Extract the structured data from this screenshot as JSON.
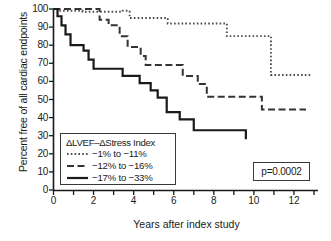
{
  "chart_data": {
    "type": "line",
    "title": "",
    "xlabel": "Years after index study",
    "ylabel": "Percent free of all cardiac endpoints",
    "xlim": [
      0,
      13.2
    ],
    "ylim": [
      0,
      100
    ],
    "xticks": [
      0,
      2,
      4,
      6,
      8,
      10,
      12
    ],
    "xticklabels": [
      "0",
      "2",
      "4",
      "6",
      "8",
      "10",
      "12"
    ],
    "xminorticks": [
      1,
      3,
      5,
      7,
      9,
      11,
      13
    ],
    "yticks": [
      0,
      10,
      20,
      30,
      40,
      50,
      60,
      70,
      80,
      90,
      100
    ],
    "yticklabels": [
      "0",
      "10",
      "20",
      "30",
      "40",
      "50",
      "60",
      "70",
      "80",
      "90",
      "100"
    ],
    "grid": false,
    "legend_position": "lower-left",
    "legend_title": "ΔLVEF–ΔStress Index",
    "annotation": "p=0.0002",
    "series": [
      {
        "name": "-1% to -11%",
        "label": "−1% to  −11%",
        "style": "dotted",
        "color": "#4d4d4d",
        "points": [
          [
            0.0,
            100
          ],
          [
            0.25,
            100
          ],
          [
            0.25,
            99
          ],
          [
            1.45,
            99
          ],
          [
            1.45,
            98.5
          ],
          [
            3.45,
            98.5
          ],
          [
            3.45,
            99
          ],
          [
            3.8,
            99
          ],
          [
            3.8,
            95
          ],
          [
            5.7,
            95
          ],
          [
            5.7,
            92
          ],
          [
            8.65,
            92
          ],
          [
            8.65,
            85
          ],
          [
            10.85,
            85
          ],
          [
            10.85,
            63.5
          ],
          [
            12.85,
            63.5
          ]
        ]
      },
      {
        "name": "-12% to -16%",
        "label": "−12% to  −16%",
        "style": "dashed",
        "color": "#333333",
        "points": [
          [
            0.0,
            100
          ],
          [
            2.3,
            100
          ],
          [
            2.3,
            94
          ],
          [
            2.75,
            94
          ],
          [
            2.75,
            91
          ],
          [
            3.3,
            91
          ],
          [
            3.3,
            85
          ],
          [
            3.7,
            85
          ],
          [
            3.7,
            79
          ],
          [
            4.35,
            79
          ],
          [
            4.35,
            74
          ],
          [
            4.6,
            74
          ],
          [
            4.6,
            69
          ],
          [
            6.45,
            69
          ],
          [
            6.45,
            63
          ],
          [
            7.2,
            63
          ],
          [
            7.2,
            58.5
          ],
          [
            7.65,
            58.5
          ],
          [
            7.65,
            51.5
          ],
          [
            10.4,
            51.5
          ],
          [
            10.4,
            44.5
          ],
          [
            12.6,
            44.5
          ]
        ]
      },
      {
        "name": "-17% to -33%",
        "label": "−17% to  −33%",
        "style": "solid",
        "color": "#1a1a1a",
        "points": [
          [
            0.0,
            100
          ],
          [
            0.2,
            100
          ],
          [
            0.2,
            96
          ],
          [
            0.4,
            96
          ],
          [
            0.4,
            91
          ],
          [
            0.6,
            91
          ],
          [
            0.6,
            86
          ],
          [
            0.85,
            86
          ],
          [
            0.85,
            80
          ],
          [
            1.5,
            80
          ],
          [
            1.5,
            77
          ],
          [
            1.75,
            77
          ],
          [
            1.75,
            72
          ],
          [
            2.0,
            72
          ],
          [
            2.0,
            67
          ],
          [
            3.45,
            67
          ],
          [
            3.45,
            63
          ],
          [
            4.3,
            63
          ],
          [
            4.3,
            59
          ],
          [
            4.85,
            59
          ],
          [
            4.85,
            55
          ],
          [
            5.2,
            55
          ],
          [
            5.2,
            51
          ],
          [
            5.65,
            51
          ],
          [
            5.65,
            43
          ],
          [
            6.3,
            43
          ],
          [
            6.3,
            39
          ],
          [
            7.0,
            39
          ],
          [
            7.0,
            33
          ],
          [
            9.6,
            33
          ],
          [
            9.6,
            28
          ]
        ]
      }
    ]
  },
  "legend": {
    "title": "ΔLVEF–ΔStress Index",
    "rows": [
      {
        "key": "dotted",
        "label": "−1% to  −11%"
      },
      {
        "key": "dashed",
        "label": "−12% to  −16%"
      },
      {
        "key": "solid",
        "label": "−17% to  −33%"
      }
    ]
  },
  "pvalue": {
    "text": "p=0.0002"
  },
  "axes": {
    "x_title": "Years after index study",
    "y_title": "Percent free of all cardiac endpoints"
  }
}
